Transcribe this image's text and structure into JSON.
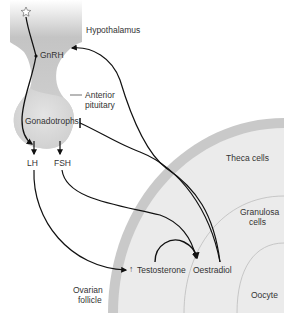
{
  "diagram": {
    "colors": {
      "hypothalamus_top": "#bdbdbd",
      "hypothalamus_bottom": "#d9d9d9",
      "pituitary": "#d6d6d6",
      "follicle_rim": "#c8c8c8",
      "follicle_inner": "#ececec",
      "line": "#111111",
      "text": "#333333"
    },
    "labels": {
      "hypothalamus": "Hypothalamus",
      "gnrh": "GnRH",
      "anterior_pituitary_1": "Anterior",
      "anterior_pituitary_2": "pituitary",
      "gonadotrophs": "Gonadotrophs",
      "lh": "LH",
      "fsh": "FSH",
      "theca_cells": "Theca cells",
      "granulosa_1": "Granulosa",
      "granulosa_2": "cells",
      "oocyte": "Oocyte",
      "ovarian_follicle_1": "Ovarian",
      "ovarian_follicle_2": "follicle",
      "testosterone": "Testosterone",
      "testosterone_prefix": "↑",
      "oestradiol": "Oestradiol"
    },
    "icons": {
      "neuron": "star-neuron-icon"
    },
    "nodes": [
      "Hypothalamus",
      "GnRH",
      "Anterior pituitary",
      "Gonadotrophs",
      "LH",
      "FSH",
      "Theca cells",
      "Granulosa cells",
      "Oocyte",
      "Ovarian follicle",
      "Testosterone",
      "Oestradiol"
    ],
    "edges": [
      {
        "from": "Hypothalamus neuron",
        "to": "GnRH",
        "type": "stimulate"
      },
      {
        "from": "GnRH",
        "to": "Gonadotrophs",
        "type": "stimulate"
      },
      {
        "from": "Gonadotrophs",
        "to": "LH",
        "type": "stimulate"
      },
      {
        "from": "Gonadotrophs",
        "to": "FSH",
        "type": "stimulate"
      },
      {
        "from": "LH",
        "to": "Testosterone",
        "type": "stimulate"
      },
      {
        "from": "FSH",
        "to": "Oestradiol",
        "type": "stimulate"
      },
      {
        "from": "Testosterone",
        "to": "Oestradiol",
        "type": "conversion"
      },
      {
        "from": "Oestradiol",
        "to": "Hypothalamus",
        "type": "feedback"
      },
      {
        "from": "Oestradiol",
        "to": "Anterior pituitary",
        "type": "inhibit"
      }
    ]
  }
}
